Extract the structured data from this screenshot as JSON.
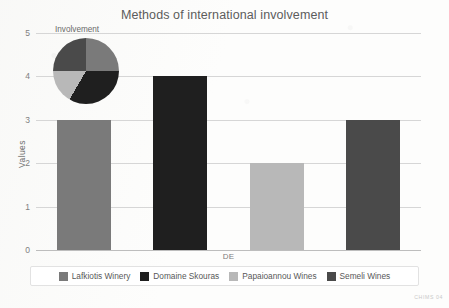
{
  "figure": {
    "watermark": "CHIMS 04",
    "background_color": "#fdfdfc"
  },
  "chart_data": {
    "type": "bar",
    "title": "Methods of international involvement",
    "xlabel": "",
    "ylabel": "Values",
    "categories": [
      "DE"
    ],
    "ylim": [
      0,
      5
    ],
    "ytick_labels": [
      "0",
      "1",
      "2",
      "3",
      "4",
      "5"
    ],
    "ytick_values": [
      0,
      1,
      2,
      3,
      4,
      5
    ],
    "grid": true,
    "legend_position": "bottom",
    "series": [
      {
        "name": "Lafkiotis Winery",
        "values": [
          3
        ],
        "color": "#7a7a7a"
      },
      {
        "name": "Domaine Skouras",
        "values": [
          4
        ],
        "color": "#1f1f1f"
      },
      {
        "name": "Papaioannou Wines",
        "values": [
          2
        ],
        "color": "#b8b8b8"
      },
      {
        "name": "Semeli Wines",
        "values": [
          3
        ],
        "color": "#4a4a4a"
      }
    ],
    "inset": {
      "type": "pie",
      "title": "Involvement",
      "labels": [
        "Lafkiotis Winery",
        "Domaine Skouras",
        "Papaioannou Wines",
        "Semeli Wines"
      ],
      "values": [
        3,
        4,
        2,
        3
      ],
      "colors": [
        "#7a7a7a",
        "#1f1f1f",
        "#b8b8b8",
        "#4a4a4a"
      ],
      "total": 12,
      "start_angle_deg": 0,
      "direction": "clockwise"
    }
  }
}
